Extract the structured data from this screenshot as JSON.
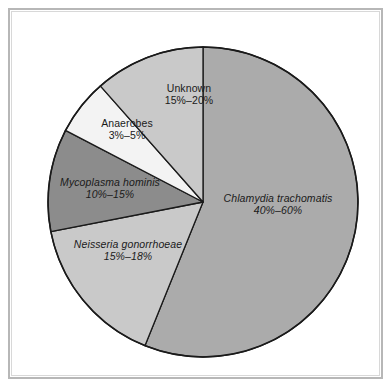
{
  "figure": {
    "background_color": "#ffffff",
    "frame_color": "#b7b7b7",
    "outline_color": "#1a1a1a"
  },
  "chart_data": {
    "type": "pie",
    "title": "",
    "subtitle": "",
    "xlabel": "",
    "ylabel": "",
    "grid": false,
    "legend_position": "none",
    "labels_placement": "inside-slices",
    "start_angle_deg": 0,
    "direction": "clockwise",
    "categories": [
      "Chlamydia trachomatis",
      "Neisseria gonorrhoeae",
      "Mycoplasma hominis",
      "Anaerobes",
      "Unknown"
    ],
    "values": [
      56.1,
      15.8,
      10.7,
      5.9,
      11.5
    ],
    "value_ranges": [
      {
        "low": 40,
        "high": 60
      },
      {
        "low": 15,
        "high": 18
      },
      {
        "low": 10,
        "high": 15
      },
      {
        "low": 3,
        "high": 5
      },
      {
        "low": 15,
        "high": 20
      }
    ],
    "slice_boundaries_deg": [
      0,
      202,
      259,
      297.5,
      318.5,
      360
    ],
    "colors": [
      "#ababab",
      "#c9c9c9",
      "#8c8c8c",
      "#f3f3f3",
      "#c9c9c9"
    ],
    "slices": [
      {
        "name": "Chlamydia trachomatis",
        "label_line1": "Chlamydia trachomatis",
        "label_line2": "40%–60%",
        "italic": true,
        "color": "#ababab",
        "start_deg": 0,
        "end_deg": 202
      },
      {
        "name": "Neisseria gonorrhoeae",
        "label_line1": "Neisseria gonorrhoeae",
        "label_line2": "15%–18%",
        "italic": true,
        "color": "#c9c9c9",
        "start_deg": 202,
        "end_deg": 259
      },
      {
        "name": "Mycoplasma hominis",
        "label_line1": "Mycoplasma hominis",
        "label_line2": "10%–15%",
        "italic": true,
        "color": "#8c8c8c",
        "start_deg": 259,
        "end_deg": 297.5
      },
      {
        "name": "Anaerobes",
        "label_line1": "Anaerobes",
        "label_line2": "3%–5%",
        "italic": false,
        "color": "#f3f3f3",
        "start_deg": 297.5,
        "end_deg": 318.5
      },
      {
        "name": "Unknown",
        "label_line1": "Unknown",
        "label_line2": "15%–20%",
        "italic": false,
        "color": "#c9c9c9",
        "start_deg": 318.5,
        "end_deg": 360
      }
    ],
    "geometry": {
      "center_x": 203,
      "center_y": 202,
      "radius": 155
    }
  }
}
